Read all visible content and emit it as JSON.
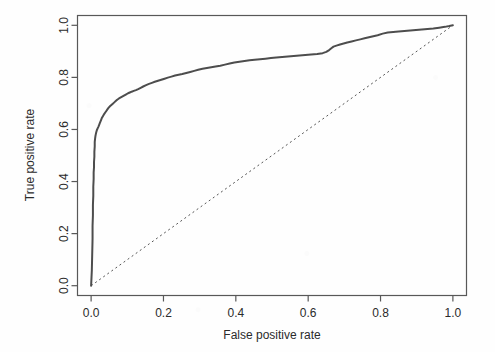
{
  "chart_data": {
    "type": "line",
    "title": "",
    "xlabel": "False positive rate",
    "ylabel": "True positive rate",
    "xlim": [
      0.0,
      1.0
    ],
    "ylim": [
      0.0,
      1.0
    ],
    "grid": false,
    "legend": null,
    "xticks": [
      "0.0",
      "0.2",
      "0.4",
      "0.6",
      "0.8",
      "1.0"
    ],
    "xtick_values": [
      0.0,
      0.2,
      0.4,
      0.6,
      0.8,
      1.0
    ],
    "yticks": [
      "0.0",
      "0.2",
      "0.4",
      "0.6",
      "0.8",
      "1.0"
    ],
    "ytick_values": [
      0.0,
      0.2,
      0.4,
      0.6,
      0.8,
      1.0
    ],
    "series": [
      {
        "name": "ROC curve",
        "style": "solid",
        "color": "#4d4d4d",
        "width": 2.0,
        "x": [
          0.0,
          0.002,
          0.003,
          0.004,
          0.004,
          0.005,
          0.005,
          0.006,
          0.006,
          0.007,
          0.007,
          0.008,
          0.008,
          0.009,
          0.009,
          0.01,
          0.01,
          0.011,
          0.012,
          0.013,
          0.014,
          0.015,
          0.016,
          0.018,
          0.02,
          0.022,
          0.024,
          0.026,
          0.028,
          0.03,
          0.033,
          0.036,
          0.039,
          0.042,
          0.045,
          0.048,
          0.052,
          0.056,
          0.06,
          0.064,
          0.068,
          0.072,
          0.077,
          0.082,
          0.087,
          0.092,
          0.097,
          0.102,
          0.107,
          0.112,
          0.118,
          0.124,
          0.13,
          0.137,
          0.144,
          0.152,
          0.16,
          0.168,
          0.176,
          0.185,
          0.194,
          0.203,
          0.212,
          0.222,
          0.232,
          0.242,
          0.252,
          0.263,
          0.274,
          0.285,
          0.296,
          0.308,
          0.32,
          0.332,
          0.344,
          0.357,
          0.37,
          0.383,
          0.396,
          0.41,
          0.424,
          0.438,
          0.452,
          0.467,
          0.482,
          0.497,
          0.512,
          0.528,
          0.544,
          0.56,
          0.576,
          0.592,
          0.608,
          0.625,
          0.64,
          0.65,
          0.658,
          0.664,
          0.67,
          0.678,
          0.688,
          0.698,
          0.708,
          0.72,
          0.732,
          0.744,
          0.756,
          0.768,
          0.78,
          0.792,
          0.806,
          0.82,
          0.835,
          0.85,
          0.866,
          0.882,
          0.898,
          0.914,
          0.93,
          0.946,
          0.962,
          0.978,
          0.99,
          1.0
        ],
        "y": [
          0.0,
          0.06,
          0.12,
          0.18,
          0.23,
          0.27,
          0.31,
          0.345,
          0.38,
          0.41,
          0.435,
          0.455,
          0.475,
          0.495,
          0.515,
          0.535,
          0.552,
          0.565,
          0.575,
          0.582,
          0.588,
          0.593,
          0.598,
          0.604,
          0.61,
          0.617,
          0.624,
          0.631,
          0.638,
          0.645,
          0.652,
          0.659,
          0.665,
          0.671,
          0.677,
          0.683,
          0.689,
          0.694,
          0.699,
          0.704,
          0.709,
          0.714,
          0.719,
          0.723,
          0.727,
          0.731,
          0.735,
          0.739,
          0.742,
          0.745,
          0.748,
          0.751,
          0.755,
          0.76,
          0.765,
          0.77,
          0.775,
          0.779,
          0.783,
          0.787,
          0.791,
          0.795,
          0.799,
          0.803,
          0.807,
          0.81,
          0.813,
          0.817,
          0.821,
          0.825,
          0.829,
          0.833,
          0.836,
          0.839,
          0.842,
          0.845,
          0.849,
          0.853,
          0.857,
          0.86,
          0.863,
          0.866,
          0.868,
          0.87,
          0.872,
          0.874,
          0.876,
          0.878,
          0.88,
          0.882,
          0.884,
          0.886,
          0.888,
          0.89,
          0.893,
          0.898,
          0.905,
          0.912,
          0.918,
          0.922,
          0.926,
          0.93,
          0.934,
          0.938,
          0.942,
          0.946,
          0.95,
          0.954,
          0.958,
          0.962,
          0.968,
          0.972,
          0.974,
          0.976,
          0.978,
          0.98,
          0.982,
          0.984,
          0.986,
          0.988,
          0.991,
          0.994,
          0.997,
          1.0
        ]
      },
      {
        "name": "chance diagonal",
        "style": "dotted",
        "color": "#555555",
        "width": 1.0,
        "x": [
          0.0,
          1.0
        ],
        "y": [
          0.0,
          1.0
        ]
      }
    ]
  },
  "axes": {
    "x_title": "False positive rate",
    "y_title": "True positive rate"
  }
}
